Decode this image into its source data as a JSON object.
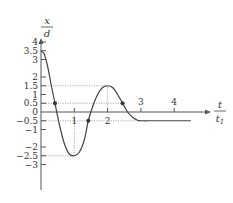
{
  "chart_data": {
    "type": "line",
    "title": "",
    "ylabel": {
      "numerator": "x",
      "denominator": "d"
    },
    "xlabel": {
      "numerator": "t",
      "denominator": "t1"
    },
    "xlim": [
      0,
      4.8
    ],
    "ylim": [
      -3.8,
      4.3
    ],
    "x_ticks": [
      1,
      2,
      3,
      4
    ],
    "y_ticks": [
      4,
      3.5,
      3,
      2,
      1.5,
      1,
      0.5,
      0,
      -0.5,
      -1,
      -2,
      -2.5,
      -3
    ],
    "y_tick_labels": [
      "4",
      "3.5",
      "3",
      "2",
      "1.5",
      "1",
      "0.5",
      "0",
      "-0.5",
      "-1",
      "-2",
      "-2.5",
      "-3"
    ],
    "x_tick_labels": [
      "1",
      "2",
      "3",
      "4"
    ],
    "series": [
      {
        "name": "displacement",
        "points": [
          [
            0,
            3.5
          ],
          [
            0.1,
            3.3
          ],
          [
            0.2,
            2.6
          ],
          [
            0.3,
            1.6
          ],
          [
            0.42,
            0.5
          ],
          [
            0.55,
            -0.7
          ],
          [
            0.7,
            -1.8
          ],
          [
            0.85,
            -2.4
          ],
          [
            1.0,
            -2.5
          ],
          [
            1.15,
            -2.3
          ],
          [
            1.3,
            -1.6
          ],
          [
            1.42,
            -0.5
          ],
          [
            1.55,
            0.3
          ],
          [
            1.7,
            1.0
          ],
          [
            1.85,
            1.4
          ],
          [
            2.0,
            1.5
          ],
          [
            2.15,
            1.4
          ],
          [
            2.3,
            1.0
          ],
          [
            2.45,
            0.5
          ],
          [
            2.6,
            0.0
          ],
          [
            2.75,
            -0.3
          ],
          [
            2.9,
            -0.47
          ],
          [
            3.0,
            -0.5
          ],
          [
            3.5,
            -0.5
          ],
          [
            4.5,
            -0.5
          ]
        ]
      }
    ],
    "marked_points": [
      [
        0.42,
        0.5
      ],
      [
        1.42,
        -0.5
      ],
      [
        2.45,
        0.5
      ]
    ],
    "reference_lines": [
      {
        "type": "h",
        "y": 1.5,
        "x_to": 2
      },
      {
        "type": "h",
        "y": 0.5,
        "x_to": 2.45
      },
      {
        "type": "h",
        "y": -0.5,
        "x_to": 3
      },
      {
        "type": "h",
        "y": -2.5,
        "x_to": 1
      },
      {
        "type": "v",
        "x": 1,
        "y_from": -2.5,
        "y_to": 0
      },
      {
        "type": "v",
        "x": 2,
        "y_from": 0,
        "y_to": 1.5
      }
    ],
    "grid": false,
    "colors": {
      "curve": "#444444",
      "axis": "#555555",
      "dotted": "#999999"
    }
  }
}
